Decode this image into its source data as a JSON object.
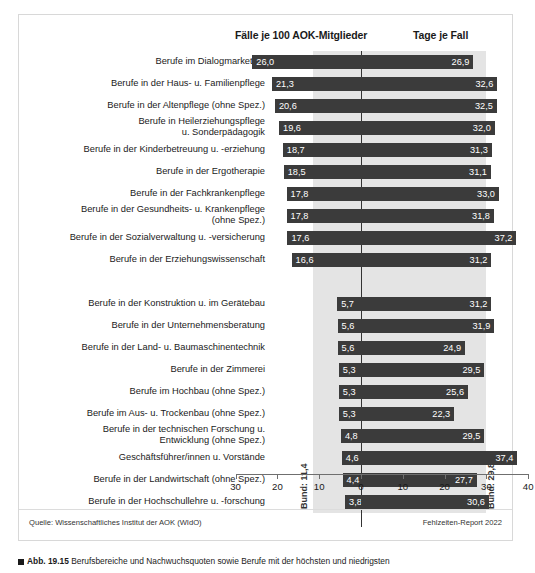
{
  "header": {
    "left_title": "Fälle je 100 AOK-Mitglieder",
    "right_title": "Tage je Fall"
  },
  "reference": {
    "bund_cases_label": "Bund: 11,4",
    "bund_days_label": "Bund: 29,8",
    "bund_cases_value": 11.4,
    "bund_days_value": 29.8
  },
  "footer": {
    "source": "Quelle: Wissenschaftliches Institut der AOK (WIdO)",
    "report": "Fehlzeiten-Report 2022"
  },
  "caption": {
    "figure_number": "Abb. 19.15",
    "text": "Berufsbereiche und Nachwuchsquoten sowie Berufe mit der höchsten und niedrigsten"
  },
  "chart_data": {
    "type": "bar",
    "orientation": "horizontal-diverging",
    "title": "",
    "xlabel": "",
    "ylabel": "",
    "grid": false,
    "legend_position": "top",
    "axis": {
      "tick_labels": [
        "30",
        "20",
        "10",
        "0",
        "10",
        "20",
        "30",
        "40"
      ],
      "tick_values": [
        -30,
        -20,
        -10,
        0,
        10,
        20,
        30,
        40
      ],
      "left_axis_name": "Fälle je 100 AOK-Mitglieder",
      "right_axis_name": "Tage je Fall",
      "left_max": 30,
      "right_max": 40
    },
    "series": [
      {
        "name": "Fälle je 100 AOK-Mitglieder",
        "direction": "left"
      },
      {
        "name": "Tage je Fall",
        "direction": "right"
      }
    ],
    "groups": [
      {
        "name": "Höchste Fallzahlen",
        "rows": [
          {
            "label": "Berufe im Dialogmarketing",
            "cases": 26.0,
            "days": 26.9,
            "cases_text": "26,0",
            "days_text": "26,9"
          },
          {
            "label": "Berufe in der Haus- u. Familienpflege",
            "cases": 21.3,
            "days": 32.6,
            "cases_text": "21,3",
            "days_text": "32,6"
          },
          {
            "label": "Berufe in der Altenpflege (ohne Spez.)",
            "cases": 20.6,
            "days": 32.5,
            "cases_text": "20,6",
            "days_text": "32,5"
          },
          {
            "label": "Berufe in Heilerziehungspflege\nu. Sonderpädagogik",
            "cases": 19.6,
            "days": 32.0,
            "cases_text": "19,6",
            "days_text": "32,0"
          },
          {
            "label": "Berufe in der Kinderbetreuung u. -erziehung",
            "cases": 18.7,
            "days": 31.3,
            "cases_text": "18,7",
            "days_text": "31,3"
          },
          {
            "label": "Berufe in der Ergotherapie",
            "cases": 18.5,
            "days": 31.1,
            "cases_text": "18,5",
            "days_text": "31,1"
          },
          {
            "label": "Berufe in der Fachkrankenpflege",
            "cases": 17.8,
            "days": 33.0,
            "cases_text": "17,8",
            "days_text": "33,0"
          },
          {
            "label": "Berufe in der Gesundheits- u. Krankenpflege\n(ohne Spez.)",
            "cases": 17.8,
            "days": 31.8,
            "cases_text": "17,8",
            "days_text": "31,8"
          },
          {
            "label": "Berufe in der Sozialverwaltung u. -versicherung",
            "cases": 17.6,
            "days": 37.2,
            "cases_text": "17,6",
            "days_text": "37,2"
          },
          {
            "label": "Berufe in der Erziehungswissenschaft",
            "cases": 16.6,
            "days": 31.2,
            "cases_text": "16,6",
            "days_text": "31,2"
          }
        ]
      },
      {
        "name": "Niedrigste Fallzahlen",
        "rows": [
          {
            "label": "Berufe in der Konstruktion u. im Gerätebau",
            "cases": 5.7,
            "days": 31.2,
            "cases_text": "5,7",
            "days_text": "31,2"
          },
          {
            "label": "Berufe in der Unternehmensberatung",
            "cases": 5.6,
            "days": 31.9,
            "cases_text": "5,6",
            "days_text": "31,9"
          },
          {
            "label": "Berufe in der Land- u. Baumaschinentechnik",
            "cases": 5.6,
            "days": 24.9,
            "cases_text": "5,6",
            "days_text": "24,9"
          },
          {
            "label": "Berufe in der Zimmerei",
            "cases": 5.3,
            "days": 29.5,
            "cases_text": "5,3",
            "days_text": "29,5"
          },
          {
            "label": "Berufe im Hochbau (ohne Spez.)",
            "cases": 5.3,
            "days": 25.6,
            "cases_text": "5,3",
            "days_text": "25,6"
          },
          {
            "label": "Berufe im Aus- u. Trockenbau (ohne Spez.)",
            "cases": 5.3,
            "days": 22.3,
            "cases_text": "5,3",
            "days_text": "22,3"
          },
          {
            "label": "Berufe in der technischen Forschung u.\nEntwicklung (ohne Spez.)",
            "cases": 4.8,
            "days": 29.5,
            "cases_text": "4,8",
            "days_text": "29,5"
          },
          {
            "label": "Geschäftsführer/innen u. Vorstände",
            "cases": 4.6,
            "days": 37.4,
            "cases_text": "4,6",
            "days_text": "37,4"
          },
          {
            "label": "Berufe in der Landwirtschaft (ohne Spez.)",
            "cases": 4.4,
            "days": 27.7,
            "cases_text": "4,4",
            "days_text": "27,7"
          },
          {
            "label": "Berufe in der Hochschullehre u. -forschung",
            "cases": 3.8,
            "days": 30.6,
            "cases_text": "3,8",
            "days_text": "30,6"
          }
        ]
      }
    ],
    "colors": {
      "bar": "#3b3b3b",
      "band": "#e4e4e4",
      "zero_line": "#333333",
      "axis": "#6f6f6f",
      "value_text": "#ffffff"
    }
  }
}
